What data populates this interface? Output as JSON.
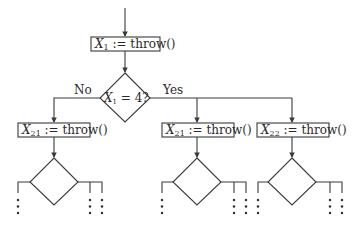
{
  "diagram": {
    "type": "flowchart",
    "colors": {
      "line": "#3a3a3a",
      "text": "#2a2a2a",
      "background": "#ffffff"
    },
    "nodes": {
      "assign_x1": {
        "var": "X",
        "sub": "1",
        "op": " := throw()"
      },
      "decision_x1": {
        "var": "X",
        "sub": "1",
        "op": " = 4?"
      },
      "assign_x21_no": {
        "var": "X",
        "sub": "21",
        "op": " := throw()"
      },
      "assign_x21_yes": {
        "var": "X",
        "sub": "21",
        "op": " := throw()"
      },
      "assign_x22_yes": {
        "var": "X",
        "sub": "22",
        "op": " := throw()"
      }
    },
    "edge_labels": {
      "no": "No",
      "yes": "Yes"
    },
    "continuation": "⋮"
  }
}
